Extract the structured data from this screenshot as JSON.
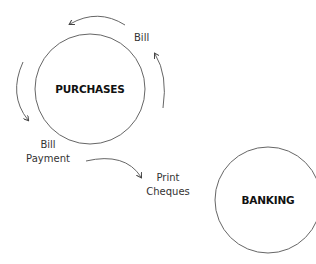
{
  "diagram": {
    "nodes": [
      {
        "id": "purchases",
        "label": "PURCHASES",
        "cx": 90,
        "cy": 89,
        "r": 55
      },
      {
        "id": "banking",
        "label": "BANKING",
        "cx": 268,
        "cy": 200,
        "r": 53
      }
    ],
    "labels": {
      "bill": "Bill",
      "bill_payment_line1": "Bill",
      "bill_payment_line2": "Payment",
      "print_cheques_line1": "Print",
      "print_cheques_line2": "Cheques"
    },
    "edges": [
      {
        "id": "top-cycle-arrow",
        "description": "curved arrow over top of Purchases, pointing left"
      },
      {
        "id": "left-cycle-arrow",
        "description": "curved arrow on left of Purchases, pointing down"
      },
      {
        "id": "right-cycle-arrow",
        "description": "curved arrow on right of Purchases, pointing up"
      },
      {
        "id": "payment-to-cheques-arrow",
        "description": "curved arrow from Bill Payment to Print Cheques"
      }
    ],
    "colors": {
      "stroke": "#555555",
      "text": "#333333",
      "node_text": "#111111"
    }
  }
}
